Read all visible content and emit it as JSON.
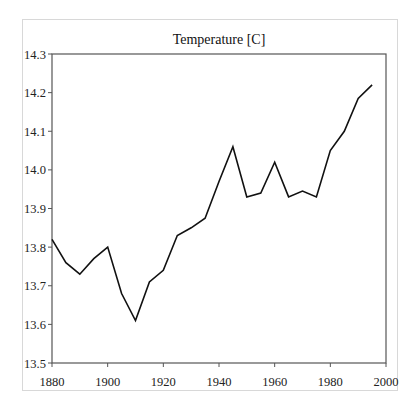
{
  "chart_data": {
    "type": "line",
    "title": "Temperature [C]",
    "xlabel": "",
    "ylabel": "",
    "xlim": [
      1880,
      2000
    ],
    "ylim": [
      13.5,
      14.3
    ],
    "x_ticks": [
      1880,
      1900,
      1920,
      1940,
      1960,
      1980,
      2000
    ],
    "x_tick_labels": [
      "1880",
      "1900",
      "1920",
      "1940",
      "1960",
      "1980",
      "2000"
    ],
    "y_ticks": [
      13.5,
      13.6,
      13.7,
      13.8,
      13.9,
      14.0,
      14.1,
      14.2,
      14.3
    ],
    "y_tick_labels": [
      "13.5",
      "13.6",
      "13.7",
      "13.8",
      "13.9",
      "14.0",
      "14.1",
      "14.2",
      "14.3"
    ],
    "grid": false,
    "legend": null,
    "series": [
      {
        "name": "Temperature",
        "color": "#111111",
        "x": [
          1880,
          1885,
          1890,
          1895,
          1900,
          1905,
          1910,
          1915,
          1920,
          1925,
          1930,
          1935,
          1940,
          1945,
          1950,
          1955,
          1960,
          1965,
          1970,
          1975,
          1980,
          1985,
          1990,
          1995
        ],
        "values": [
          13.82,
          13.76,
          13.73,
          13.77,
          13.8,
          13.68,
          13.61,
          13.71,
          13.74,
          13.83,
          13.85,
          13.875,
          13.97,
          14.06,
          13.93,
          13.94,
          14.02,
          13.93,
          13.945,
          13.93,
          14.05,
          14.1,
          14.185,
          14.22
        ]
      }
    ]
  },
  "colors": {
    "frame_border": "#d8d8d8",
    "plot_border": "#555555",
    "line": "#111111"
  }
}
